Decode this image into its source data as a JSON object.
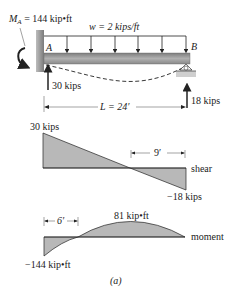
{
  "beam": {
    "moment_label": "M",
    "moment_sub": "A",
    "moment_value": " = 144 kip•ft",
    "load_label": "w = 2 kips/ft",
    "point_a": "A",
    "point_b": "B",
    "reaction_a": "30 kips",
    "reaction_b": "18 kips",
    "length_label": "L = 24′"
  },
  "shear": {
    "max_label": "30 kips",
    "min_label": "−18 kips",
    "dim_label": "9′",
    "name": "shear"
  },
  "moment": {
    "max_label": "81 kip•ft",
    "min_label": "−144 kip•ft",
    "dim_label": "6′",
    "name": "moment"
  },
  "caption": "(a)",
  "colors": {
    "fill": "#b8b8b8",
    "beam": "#9a9a9a",
    "wall": "#8c8c8c",
    "line": "#222222"
  }
}
